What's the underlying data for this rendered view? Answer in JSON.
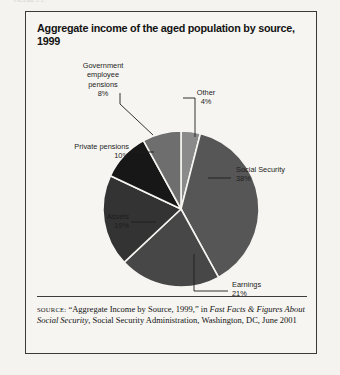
{
  "page": {
    "top_fragment": "FIGURE 2.3",
    "background_color": "#f4f3ef",
    "border_color": "#3a3a3a"
  },
  "figure": {
    "title": "Aggregate income of the aged population by source, 1999"
  },
  "source_note": {
    "keyword": "source:",
    "part1": " “Aggregate Income by Source, 1999,” in ",
    "italic1": "Fast Facts & Figures About Social Security",
    "part2": ", Social Security Administration, Washington, DC, June 2001"
  },
  "labels": {
    "government": {
      "name": "Government employee pensions",
      "line1": "Government",
      "line2": "employee",
      "line3": "pensions",
      "percent": "8%"
    },
    "other": {
      "name": "Other",
      "percent": "4%"
    },
    "private": {
      "name": "Private pensions",
      "percent": "10%"
    },
    "assets": {
      "name": "Assets",
      "percent": "19%"
    },
    "social_security": {
      "name": "Social Security",
      "percent": "38%"
    },
    "earnings": {
      "name": "Earnings",
      "percent": "21%"
    }
  },
  "chart_data": {
    "type": "pie",
    "title": "Aggregate income of the aged population by source, 1999",
    "xlabel": "",
    "ylabel": "",
    "unit": "percent",
    "total": 100,
    "legend": "none (direct labels with leader lines)",
    "start_angle_deg": 0,
    "direction": "clockwise",
    "categories": [
      "Other",
      "Social Security",
      "Earnings",
      "Assets",
      "Private pensions",
      "Government employee pensions"
    ],
    "values": [
      4,
      38,
      21,
      19,
      10,
      8
    ],
    "colors": [
      "#8a8a8a",
      "#565656",
      "#474747",
      "#333333",
      "#171717",
      "#6e6e6e"
    ],
    "slices": [
      {
        "label": "Other",
        "value": 4,
        "display": "4%",
        "color": "#8a8a8a"
      },
      {
        "label": "Social Security",
        "value": 38,
        "display": "38%",
        "color": "#565656"
      },
      {
        "label": "Earnings",
        "value": 21,
        "display": "21%",
        "color": "#474747"
      },
      {
        "label": "Assets",
        "value": 19,
        "display": "19%",
        "color": "#333333"
      },
      {
        "label": "Private pensions",
        "value": 10,
        "display": "10%",
        "color": "#171717"
      },
      {
        "label": "Government employee pensions",
        "value": 8,
        "display": "8%",
        "color": "#6e6e6e"
      }
    ]
  }
}
